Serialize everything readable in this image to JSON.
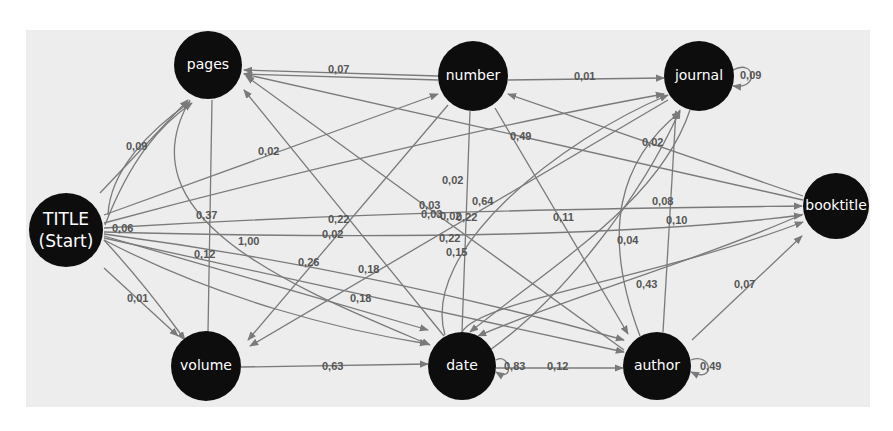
{
  "diagram": {
    "type": "state-transition-graph",
    "colors": {
      "background": "#ededed",
      "node_fill": "#0d0d0d",
      "node_text": "#ffffff",
      "edge": "#7a7a7a",
      "edge_label": "#555555"
    },
    "nodes": [
      {
        "id": "title",
        "label_line1": "TITLE",
        "label_line2": "(Start)",
        "x": 66,
        "y": 230,
        "r": 37
      },
      {
        "id": "pages",
        "label": "pages",
        "x": 208,
        "y": 65,
        "r": 34
      },
      {
        "id": "number",
        "label": "number",
        "x": 473,
        "y": 76,
        "r": 35
      },
      {
        "id": "journal",
        "label": "journal",
        "x": 699,
        "y": 76,
        "r": 35
      },
      {
        "id": "booktitle",
        "label": "booktitle",
        "x": 836,
        "y": 206,
        "r": 33
      },
      {
        "id": "volume",
        "label": "volume",
        "x": 206,
        "y": 366,
        "r": 35
      },
      {
        "id": "date",
        "label": "date",
        "x": 462,
        "y": 366,
        "r": 34
      },
      {
        "id": "author",
        "label": "author",
        "x": 657,
        "y": 366,
        "r": 34
      }
    ],
    "edge_labels": [
      {
        "text": "0,09",
        "x": 126,
        "y": 150
      },
      {
        "text": "0,02",
        "x": 258,
        "y": 155
      },
      {
        "text": "0,07",
        "x": 328,
        "y": 73
      },
      {
        "text": "0,01",
        "x": 574,
        "y": 80
      },
      {
        "text": "0,09",
        "x": 740,
        "y": 79
      },
      {
        "text": "0,49",
        "x": 510,
        "y": 140
      },
      {
        "text": "0,02",
        "x": 642,
        "y": 146
      },
      {
        "text": "0,02",
        "x": 442,
        "y": 184
      },
      {
        "text": "0,64",
        "x": 472,
        "y": 205
      },
      {
        "text": "0,08",
        "x": 652,
        "y": 205
      },
      {
        "text": "0,10",
        "x": 666,
        "y": 224
      },
      {
        "text": "0,03",
        "x": 419,
        "y": 209
      },
      {
        "text": "0,03",
        "x": 421,
        "y": 218
      },
      {
        "text": "0,02",
        "x": 440,
        "y": 220
      },
      {
        "text": "0,22",
        "x": 456,
        "y": 221
      },
      {
        "text": "0,22",
        "x": 439,
        "y": 242
      },
      {
        "text": "0,15",
        "x": 446,
        "y": 256
      },
      {
        "text": "0,11",
        "x": 553,
        "y": 221
      },
      {
        "text": "0,04",
        "x": 617,
        "y": 244
      },
      {
        "text": "0,37",
        "x": 196,
        "y": 219
      },
      {
        "text": "0,06",
        "x": 112,
        "y": 232
      },
      {
        "text": "1,00",
        "x": 238,
        "y": 245
      },
      {
        "text": "0,22",
        "x": 328,
        "y": 223
      },
      {
        "text": "0,02",
        "x": 322,
        "y": 238
      },
      {
        "text": "0,12",
        "x": 194,
        "y": 258
      },
      {
        "text": "0,26",
        "x": 298,
        "y": 266
      },
      {
        "text": "0,18",
        "x": 358,
        "y": 273
      },
      {
        "text": "0,18",
        "x": 350,
        "y": 302
      },
      {
        "text": "0,43",
        "x": 636,
        "y": 288
      },
      {
        "text": "0,07",
        "x": 734,
        "y": 288
      },
      {
        "text": "0,01",
        "x": 127,
        "y": 302
      },
      {
        "text": "0,63",
        "x": 322,
        "y": 370
      },
      {
        "text": "0,83",
        "x": 504,
        "y": 370
      },
      {
        "text": "0,12",
        "x": 547,
        "y": 370
      },
      {
        "text": "0,49",
        "x": 700,
        "y": 370
      }
    ]
  }
}
